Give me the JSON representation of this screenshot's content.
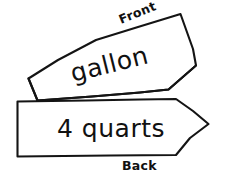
{
  "canvas": {
    "width": 229,
    "height": 179,
    "background_color": "#ffffff",
    "ink_color": "#141414",
    "text_color": "#111111"
  },
  "diagram": {
    "style": "hand-drawn black line art on white"
  },
  "banners": [
    {
      "id": "front-banner",
      "label": "gallon",
      "side_label": "Front",
      "label_rotation_deg": -14,
      "side_label_rotation_deg": -22,
      "shape": "tilted arrow banner pointing up-right",
      "points": "28,78 37,100 168,89 196,65 180,14 100,39"
    },
    {
      "id": "back-banner",
      "label": "4 quarts",
      "side_label": "Back",
      "label_rotation_deg": 0,
      "side_label_rotation_deg": 0,
      "shape": "horizontal arrow banner pointing right",
      "points": "17,101 175,99 208,124 176,155 17,156"
    }
  ],
  "text": {
    "gallon": "gallon",
    "quarts": "4 quarts",
    "front": "Front",
    "back": "Back"
  }
}
